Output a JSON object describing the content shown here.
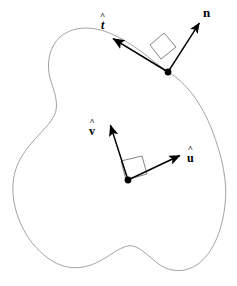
{
  "figure": {
    "type": "geometry-diagram",
    "canvas": {
      "width": 237,
      "height": 286
    },
    "colors": {
      "background": "#ffffff",
      "curve_stroke": "#999999",
      "vector_stroke": "#000000",
      "right_angle_stroke": "#777777",
      "point_fill": "#000000",
      "label_color": "#000000"
    },
    "boundary_curve": {
      "name": "closed-region-outline",
      "stroke_width": 0.9,
      "closed": true,
      "path": "M 168 72 C 186 82 202 104 212 130 C 222 156 228 182 225 205 C 222 232 212 254 198 264 C 184 274 168 272 156 262 C 144 252 136 244 128 246 C 118 248 110 256 98 262 C 84 269 68 270 54 262 C 38 253 24 236 17 214 C 10 192 12 172 22 156 C 33 138 48 128 54 116 C 60 104 54 92 50 78 C 46 62 50 46 60 37 C 72 27 88 26 104 31 C 122 37 140 50 152 60 Z"
    },
    "boundary_frame": {
      "name": "tangent-normal-frame",
      "origin_point": {
        "x": 168,
        "y": 72,
        "radius": 3.4
      },
      "right_angle_marker": {
        "name": "right-angle-marker-boundary",
        "points": "150 45 164 33 176 47 161 59"
      },
      "vectors": [
        {
          "id": "tangent",
          "label_symbol": "t",
          "label_accent": "^",
          "label_style": "italic",
          "from": {
            "x": 168,
            "y": 72
          },
          "to": {
            "x": 112,
            "y": 38
          },
          "stroke_width": 1.6,
          "arrowhead": true
        },
        {
          "id": "normal",
          "label_symbol": "n",
          "label_accent": "",
          "label_style": "upright",
          "from": {
            "x": 168,
            "y": 72
          },
          "to": {
            "x": 200,
            "y": 22
          },
          "stroke_width": 1.4,
          "arrowhead": true
        }
      ]
    },
    "interior_frame": {
      "name": "uv-orthonormal-frame",
      "origin_point": {
        "x": 128,
        "y": 180,
        "radius": 3.4
      },
      "right_angle_marker": {
        "name": "right-angle-marker-interior",
        "points": "121 161 142 156 147 174 126 180"
      },
      "vectors": [
        {
          "id": "u-hat",
          "label_symbol": "u",
          "label_accent": "^",
          "label_style": "upright",
          "from": {
            "x": 128,
            "y": 180
          },
          "to": {
            "x": 181,
            "y": 155
          },
          "stroke_width": 1.5,
          "arrowhead": true
        },
        {
          "id": "v-hat",
          "label_symbol": "v",
          "label_accent": "^",
          "label_style": "upright",
          "from": {
            "x": 128,
            "y": 180
          },
          "to": {
            "x": 110,
            "y": 124
          },
          "stroke_width": 1.5,
          "arrowhead": true
        }
      ]
    },
    "labels": {
      "tangent_hat": "^",
      "tangent_symbol": "t",
      "normal_symbol": "n",
      "u_hat": "^",
      "u_symbol": "u",
      "v_hat": "^",
      "v_symbol": "v"
    }
  }
}
